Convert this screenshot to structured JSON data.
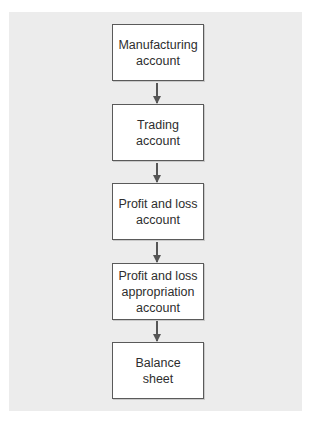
{
  "diagram": {
    "type": "flowchart",
    "direction": "top-to-bottom",
    "nodes": [
      {
        "id": "manufacturing",
        "label": "Manufacturing account"
      },
      {
        "id": "trading",
        "label": "Trading account"
      },
      {
        "id": "profit_loss",
        "label": "Profit and loss account"
      },
      {
        "id": "appropriation",
        "label": "Profit and loss appropriation account"
      },
      {
        "id": "balance",
        "label": "Balance sheet"
      }
    ],
    "edges": [
      {
        "from": "manufacturing",
        "to": "trading"
      },
      {
        "from": "trading",
        "to": "profit_loss"
      },
      {
        "from": "profit_loss",
        "to": "appropriation"
      },
      {
        "from": "appropriation",
        "to": "balance"
      }
    ],
    "colors": {
      "panel": "#ececec",
      "box_fill": "#ffffff",
      "box_border": "#5a5a5a",
      "arrow": "#555555",
      "text": "#2e2e2e"
    }
  }
}
